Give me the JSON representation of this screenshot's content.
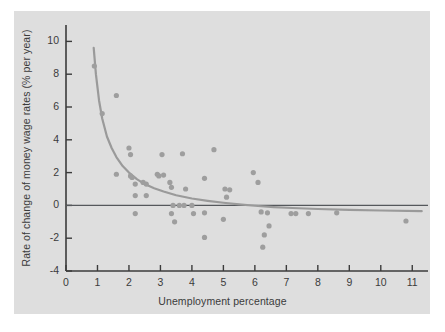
{
  "figure": {
    "background_color": "#ffffff",
    "panel_color": "#dedede",
    "ink_color": "#3b3b3b",
    "curve_color": "#9a9a9a",
    "point_color": "#9e9e9e",
    "zero_line_color": "#55585c"
  },
  "chart_data": {
    "type": "scatter",
    "title": "",
    "subtitle": "",
    "xlabel": "Unemployment percentage",
    "ylabel": "Rate of change of money wage rates (% per year)",
    "xlim": [
      0,
      11.5
    ],
    "ylim": [
      -4,
      11
    ],
    "xticks": [
      0,
      1,
      2,
      3,
      4,
      5,
      6,
      7,
      8,
      9,
      10,
      11
    ],
    "xtick_labels": [
      "0",
      "1",
      "2",
      "3",
      "4",
      "5",
      "6",
      "7",
      "8",
      "9",
      "10",
      "11"
    ],
    "yticks": [
      -4,
      -2,
      0,
      2,
      4,
      6,
      8,
      10
    ],
    "ytick_labels": [
      "-4",
      "-2",
      "0",
      "2",
      "4",
      "6",
      "8",
      "10"
    ],
    "grid": false,
    "legend": "none",
    "annotations": [
      {
        "name": "zero-reference-line",
        "type": "horizontal-line",
        "y": 0
      }
    ],
    "series": [
      {
        "name": "Phillips curve observations",
        "marker": "circle",
        "points": [
          [
            0.9,
            8.5
          ],
          [
            1.15,
            5.6
          ],
          [
            1.6,
            6.7
          ],
          [
            1.6,
            1.9
          ],
          [
            2.0,
            3.5
          ],
          [
            2.05,
            3.1
          ],
          [
            2.05,
            1.8
          ],
          [
            2.1,
            1.7
          ],
          [
            2.2,
            1.3
          ],
          [
            2.2,
            0.6
          ],
          [
            2.2,
            -0.5
          ],
          [
            2.45,
            1.4
          ],
          [
            2.55,
            1.3
          ],
          [
            2.55,
            0.6
          ],
          [
            2.9,
            1.9
          ],
          [
            2.95,
            1.8
          ],
          [
            3.05,
            3.1
          ],
          [
            3.1,
            1.85
          ],
          [
            3.3,
            1.4
          ],
          [
            3.35,
            1.1
          ],
          [
            3.35,
            -0.5
          ],
          [
            3.4,
            0.0
          ],
          [
            3.45,
            -1.0
          ],
          [
            3.6,
            0.0
          ],
          [
            3.7,
            3.15
          ],
          [
            3.75,
            0.0
          ],
          [
            3.8,
            1.0
          ],
          [
            4.0,
            0.0
          ],
          [
            4.05,
            -0.5
          ],
          [
            4.4,
            1.65
          ],
          [
            4.4,
            -0.45
          ],
          [
            4.4,
            -1.95
          ],
          [
            4.7,
            3.4
          ],
          [
            5.0,
            -0.85
          ],
          [
            5.05,
            1.0
          ],
          [
            5.1,
            0.5
          ],
          [
            5.2,
            0.95
          ],
          [
            5.95,
            2.0
          ],
          [
            6.1,
            1.4
          ],
          [
            6.2,
            -0.4
          ],
          [
            6.25,
            -2.55
          ],
          [
            6.3,
            -1.8
          ],
          [
            6.4,
            -0.45
          ],
          [
            6.45,
            -1.25
          ],
          [
            7.15,
            -0.5
          ],
          [
            7.3,
            -0.5
          ],
          [
            7.7,
            -0.5
          ],
          [
            8.6,
            -0.45
          ],
          [
            10.8,
            -0.95
          ]
        ]
      }
    ],
    "fitted_curve": {
      "name": "Fitted Phillips curve",
      "description": "Downward-sloping hyperbolic curve asymptotic to a slightly negative wage-change rate",
      "points": [
        [
          0.88,
          9.6
        ],
        [
          0.95,
          8.0
        ],
        [
          1.05,
          6.4
        ],
        [
          1.15,
          5.3
        ],
        [
          1.3,
          4.2
        ],
        [
          1.45,
          3.5
        ],
        [
          1.6,
          2.95
        ],
        [
          1.8,
          2.4
        ],
        [
          2.0,
          2.0
        ],
        [
          2.25,
          1.6
        ],
        [
          2.5,
          1.3
        ],
        [
          2.8,
          1.05
        ],
        [
          3.1,
          0.85
        ],
        [
          3.5,
          0.62
        ],
        [
          4.0,
          0.42
        ],
        [
          4.5,
          0.28
        ],
        [
          5.0,
          0.16
        ],
        [
          5.5,
          0.06
        ],
        [
          6.0,
          -0.02
        ],
        [
          6.6,
          -0.1
        ],
        [
          7.2,
          -0.16
        ],
        [
          8.0,
          -0.22
        ],
        [
          9.0,
          -0.27
        ],
        [
          10.0,
          -0.31
        ],
        [
          11.3,
          -0.35
        ]
      ]
    }
  }
}
